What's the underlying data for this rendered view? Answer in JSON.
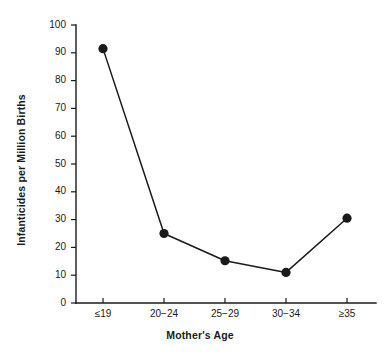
{
  "chart_data": {
    "type": "line",
    "title": "",
    "xlabel": "Mother's Age",
    "ylabel": "Infanticides per Million Births",
    "categories": [
      "≤19",
      "20−24",
      "25−29",
      "30−34",
      "≥35"
    ],
    "values": [
      91.5,
      25.0,
      15.2,
      11.0,
      30.5
    ],
    "series": [
      {
        "name": "Infanticides per Million Births",
        "values": [
          91.5,
          25.0,
          15.2,
          11.0,
          30.5
        ]
      }
    ],
    "ylim": [
      0,
      100
    ],
    "yticks": [
      0,
      10,
      20,
      30,
      40,
      50,
      60,
      70,
      80,
      90,
      100
    ],
    "ytick_labels": [
      "0",
      "10",
      "20",
      "30",
      "40",
      "50",
      "60",
      "70",
      "80",
      "90",
      "100"
    ],
    "xtick_labels": [
      "≤19",
      "20−24",
      "25−29",
      "30−34",
      "≥35"
    ],
    "grid": false,
    "legend": false,
    "legend_position": "none",
    "marker": "filled-circle",
    "line_color": "#1a1a1a",
    "marker_color": "#1a1a1a",
    "background_color": "#ffffff",
    "spines": [
      "left",
      "bottom"
    ],
    "tick_direction": "out"
  }
}
